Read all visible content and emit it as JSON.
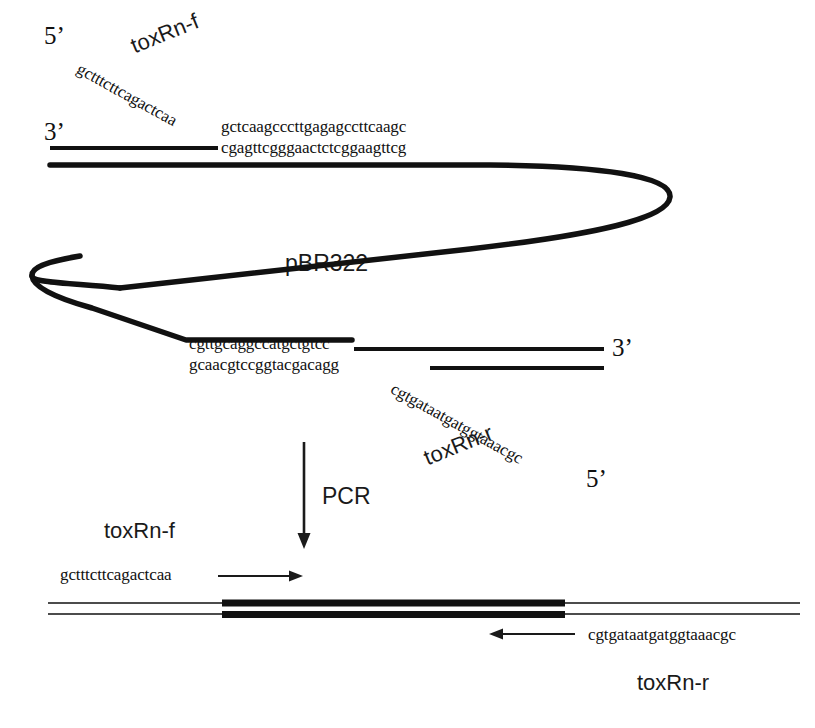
{
  "figure": {
    "plasmid_label": "pBR322",
    "pcr_label": "PCR"
  },
  "top_duplex": {
    "five_prime_label": "5’",
    "three_prime_label": "3’",
    "primer_name": "toxRn-f",
    "primer_sequence": "gctttcttcagactcaa",
    "top_strand_sequence": "gctcaagcccttgagagccttcaagc",
    "bottom_strand_sequence": "cgagttcgggaactctcggaagttcg"
  },
  "bottom_duplex": {
    "three_prime_label": "3’",
    "five_prime_label": "5’",
    "primer_name": "toxRn-r",
    "primer_sequence": "cgtgataatgatggtaaacgc",
    "top_strand_sequence": "cgttgcaggccatgctgtcc",
    "bottom_strand_sequence": "gcaacgtccggtacgacagg"
  },
  "product": {
    "forward_primer_name": "toxRn-f",
    "forward_primer_sequence": "gctttcttcagactcaa",
    "reverse_primer_name": "toxRn-r",
    "reverse_primer_sequence": "cgtgataatgatggtaaacgc"
  },
  "colors": {
    "ink": "#111111",
    "label_ink": "#1a1a1a",
    "background": "#ffffff"
  }
}
